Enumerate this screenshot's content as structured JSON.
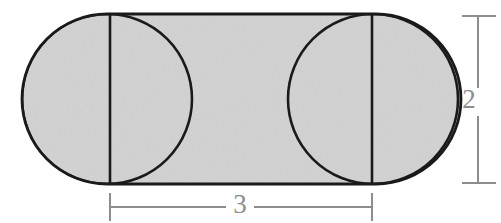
{
  "figure": {
    "kind": "geometry-diagram",
    "background_color": "#ffffff",
    "fill_color": "#d2d2d2",
    "stroke_color": "#1a1a1a",
    "dimension_color": "#8d8d8d",
    "shape": {
      "name": "stadium",
      "left": 22,
      "right": 461,
      "top": 14,
      "bottom": 184,
      "radius": 85
    },
    "circles": [
      {
        "name": "left-circle",
        "cx": 107,
        "cy": 99,
        "r": 85
      },
      {
        "name": "right-circle",
        "cx": 373,
        "cy": 99,
        "r": 85
      }
    ],
    "chords": [
      {
        "name": "left-chord",
        "x": 110,
        "y1": 14,
        "y2": 184
      },
      {
        "name": "right-chord",
        "x": 372,
        "y1": 14,
        "y2": 184
      }
    ],
    "dimensions": [
      {
        "name": "width-dimension",
        "label": "3",
        "orientation": "horizontal",
        "value": 3,
        "axis_position": 207,
        "from": 110,
        "to": 372,
        "label_position": {
          "x": 240,
          "y": 207
        }
      },
      {
        "name": "height-dimension",
        "label": "2",
        "orientation": "vertical",
        "value": 2,
        "axis_position": 478,
        "from": 16,
        "to": 183,
        "label_position": {
          "x": 469,
          "y": 102
        }
      }
    ]
  }
}
